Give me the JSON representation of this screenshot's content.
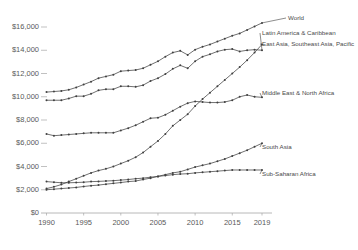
{
  "chart_data": {
    "type": "line",
    "title": "",
    "subtitle": "",
    "xlabel": "",
    "ylabel": "",
    "x": [
      1990,
      1991,
      1992,
      1993,
      1994,
      1995,
      1996,
      1997,
      1998,
      1999,
      2000,
      2001,
      2002,
      2003,
      2004,
      2005,
      2006,
      2007,
      2008,
      2009,
      2010,
      2011,
      2012,
      2013,
      2014,
      2015,
      2016,
      2017,
      2018,
      2019
    ],
    "xlim": [
      1989,
      2020
    ],
    "ylim": [
      0,
      17000
    ],
    "yticks": [
      0,
      2000,
      4000,
      6000,
      8000,
      10000,
      12000,
      14000,
      16000
    ],
    "ytick_labels": [
      "$0",
      "$2,000",
      "$4,000",
      "$6,000",
      "$8,000",
      "$10,000",
      "$12,000",
      "$14,000",
      "$16,000"
    ],
    "xticks": [
      1990,
      1995,
      2000,
      2005,
      2010,
      2015,
      2019
    ],
    "xtick_labels": [
      "1990",
      "1995",
      "2000",
      "2005",
      "2010",
      "2015",
      "2019"
    ],
    "grid": false,
    "legend_position": "right-inline",
    "marker": "dot",
    "line_color": "#404040",
    "axis_color": "#a6a6a6",
    "tick_text_color": "#595959",
    "series": [
      {
        "name": "World",
        "label": "World",
        "label_x": 288,
        "label_y": 14,
        "values": [
          10400,
          10450,
          10500,
          10600,
          10800,
          11050,
          11300,
          11600,
          11750,
          11900,
          12200,
          12250,
          12300,
          12450,
          12750,
          13050,
          13450,
          13800,
          13950,
          13600,
          14050,
          14300,
          14500,
          14750,
          15000,
          15250,
          15450,
          15750,
          16050,
          16350
        ]
      },
      {
        "name": "Latin America & Caribbean",
        "label": "Latin America & Caribbean",
        "label_x": 262,
        "label_y": 29,
        "values": [
          9700,
          9700,
          9700,
          9850,
          10050,
          10050,
          10250,
          10550,
          10650,
          10650,
          10900,
          10900,
          10850,
          11000,
          11350,
          11600,
          11950,
          12400,
          12700,
          12450,
          13050,
          13450,
          13650,
          13900,
          14050,
          14100,
          13900,
          14000,
          14050,
          14000
        ]
      },
      {
        "name": "East Asia, Southeast Asia, Pacific",
        "label": "East Asia, Southeast Asia, Pacific",
        "label_x": 262,
        "label_y": 40,
        "values": [
          2100,
          2250,
          2450,
          2700,
          2950,
          3200,
          3450,
          3650,
          3800,
          4000,
          4250,
          4500,
          4800,
          5200,
          5700,
          6200,
          6800,
          7500,
          8000,
          8500,
          9200,
          9800,
          10350,
          10900,
          11450,
          12000,
          12550,
          13150,
          13800,
          14500
        ]
      },
      {
        "name": "Middle East & North Africa",
        "label": "Middle East & North Africa",
        "label_x": 262,
        "label_y": 89,
        "values": [
          6800,
          6650,
          6700,
          6750,
          6800,
          6850,
          6900,
          6900,
          6900,
          6900,
          7100,
          7300,
          7550,
          7850,
          8150,
          8200,
          8450,
          8800,
          9150,
          9450,
          9600,
          9550,
          9500,
          9500,
          9550,
          9700,
          10000,
          10150,
          10000,
          9950
        ]
      },
      {
        "name": "South Asia",
        "label": "South Asia",
        "label_x": 262,
        "label_y": 143,
        "values": [
          2000,
          2050,
          2100,
          2150,
          2200,
          2280,
          2350,
          2400,
          2480,
          2550,
          2620,
          2700,
          2750,
          2880,
          3000,
          3150,
          3300,
          3450,
          3550,
          3750,
          3950,
          4100,
          4250,
          4450,
          4650,
          4900,
          5150,
          5400,
          5700,
          6000
        ]
      },
      {
        "name": "Sub-Saharan Africa",
        "label": "Sub-Saharan Africa",
        "label_x": 262,
        "label_y": 170,
        "values": [
          2700,
          2650,
          2600,
          2600,
          2620,
          2650,
          2700,
          2720,
          2750,
          2780,
          2830,
          2880,
          2950,
          3000,
          3080,
          3150,
          3220,
          3300,
          3350,
          3380,
          3450,
          3500,
          3550,
          3600,
          3650,
          3700,
          3700,
          3700,
          3700,
          3700
        ]
      }
    ]
  },
  "axis": {
    "y_axis_name": "y-axis",
    "x_axis_name": "x-axis"
  }
}
